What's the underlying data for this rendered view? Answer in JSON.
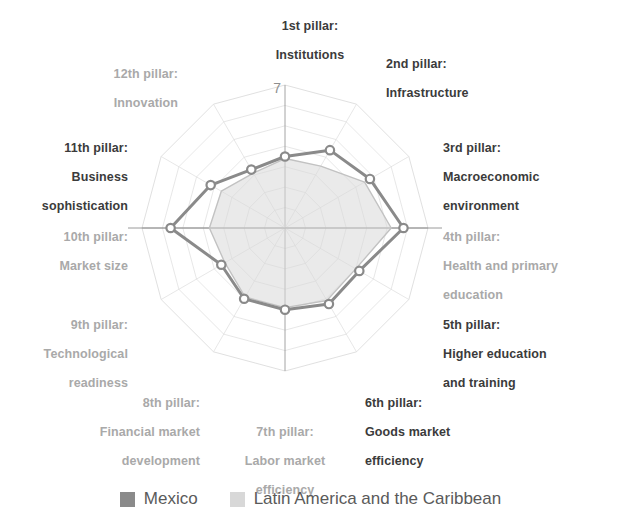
{
  "chart_data": {
    "type": "radar",
    "title": "",
    "axis_max_label": "7",
    "rmax": 7,
    "rings": [
      1,
      2,
      3,
      4,
      5,
      6,
      7
    ],
    "grid": true,
    "legend_position": "bottom",
    "categories": [
      "1st pillar: Institutions",
      "2nd pillar: Infrastructure",
      "3rd pillar: Macroeconomic environment",
      "4th pillar: Health and primary education",
      "5th pillar: Higher education and training",
      "6th pillar: Goods market efficiency",
      "7th pillar: Labor market efficiency",
      "8th pillar: Financial market development",
      "9th pillar: Technological readiness",
      "10th pillar: Market size",
      "11th pillar: Business sophistication",
      "12th pillar: Innovation"
    ],
    "series": [
      {
        "name": "Mexico",
        "color": "#8a8a8a",
        "values": [
          3.5,
          4.4,
          4.8,
          5.8,
          4.2,
          4.3,
          4.0,
          4.0,
          3.6,
          5.6,
          4.2,
          3.3
        ]
      },
      {
        "name": "Latin America and the Caribbean",
        "color": "#d8d8d8",
        "values": [
          3.4,
          3.5,
          4.5,
          5.2,
          4.0,
          4.1,
          3.9,
          3.9,
          3.4,
          3.7,
          3.6,
          3.1
        ]
      }
    ]
  },
  "axis_labels": [
    {
      "id": "p1",
      "line1": "1st pillar:",
      "line2": "Institutions",
      "line3": "",
      "emphasis": "bold",
      "align": "center"
    },
    {
      "id": "p2",
      "line1": "2nd pillar:",
      "line2": "Infrastructure",
      "line3": "",
      "emphasis": "bold",
      "align": "left"
    },
    {
      "id": "p3",
      "line1": "3rd pillar:",
      "line2": "Macroeconomic",
      "line3": "environment",
      "emphasis": "bold",
      "align": "left"
    },
    {
      "id": "p4",
      "line1": "4th pillar:",
      "line2": "Health and primary",
      "line3": "education",
      "emphasis": "faded",
      "align": "left"
    },
    {
      "id": "p5",
      "line1": "5th pillar:",
      "line2": "Higher education",
      "line3": "and training",
      "emphasis": "bold",
      "align": "left"
    },
    {
      "id": "p6",
      "line1": "6th pillar:",
      "line2": "Goods market",
      "line3": "efficiency",
      "emphasis": "bold",
      "align": "left"
    },
    {
      "id": "p7",
      "line1": "7th pillar:",
      "line2": "Labor market",
      "line3": "efficiency",
      "emphasis": "faded",
      "align": "center"
    },
    {
      "id": "p8",
      "line1": "8th pillar:",
      "line2": "Financial market",
      "line3": "development",
      "emphasis": "faded",
      "align": "right"
    },
    {
      "id": "p9",
      "line1": "9th pillar:",
      "line2": "Technological",
      "line3": "readiness",
      "emphasis": "faded",
      "align": "right"
    },
    {
      "id": "p10",
      "line1": "10th pillar:",
      "line2": "Market size",
      "line3": "",
      "emphasis": "faded",
      "align": "right"
    },
    {
      "id": "p11",
      "line1": "11th pillar:",
      "line2": "Business",
      "line3": "sophistication",
      "emphasis": "bold",
      "align": "right"
    },
    {
      "id": "p12",
      "line1": "12th pillar:",
      "line2": "Innovation",
      "line3": "",
      "emphasis": "faded",
      "align": "right"
    }
  ],
  "legend": {
    "items": [
      {
        "label": "Mexico",
        "color": "#8a8a8a"
      },
      {
        "label": "Latin America and the Caribbean",
        "color": "#d8d8d8"
      }
    ]
  },
  "colors": {
    "mexico": "#8a8a8a",
    "latam": "#d8d8d8",
    "grid": "#dcdcdc",
    "axis": "#9a9a9a",
    "text_bold": "#3b3b3b",
    "text_faded": "#a9a9a9",
    "legend_text": "#5a5a5a",
    "marker_fill": "#ffffff"
  }
}
